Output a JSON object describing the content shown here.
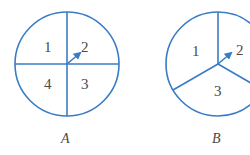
{
  "colors": {
    "stroke": "#3a7cc4",
    "text": "#4a4a4a"
  },
  "spinners": [
    {
      "caption": "A",
      "sectors": [
        "1",
        "2",
        "3",
        "4"
      ]
    },
    {
      "caption": "B",
      "sectors": [
        "1",
        "2",
        "3"
      ]
    }
  ]
}
